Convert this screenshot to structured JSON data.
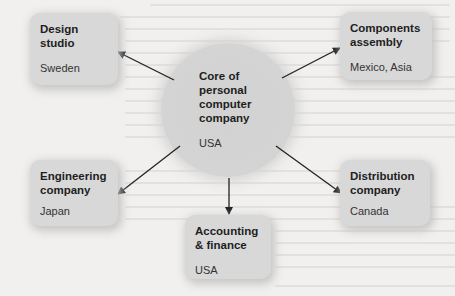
{
  "diagram": {
    "center": {
      "title": "Core of\npersonal\ncomputer\ncompany",
      "location": "USA"
    },
    "nodes": [
      {
        "id": "design",
        "title": "Design\nstudio",
        "location": "Sweden"
      },
      {
        "id": "components",
        "title": "Components\nassembly",
        "location": "Mexico, Asia"
      },
      {
        "id": "engineering",
        "title": "Engineering\ncompany",
        "location": "Japan"
      },
      {
        "id": "accounting",
        "title": "Accounting\n& finance",
        "location": "USA"
      },
      {
        "id": "distribution",
        "title": "Distribution\ncompany",
        "location": "Canada"
      }
    ],
    "edges": [
      {
        "from": "center",
        "to": "design"
      },
      {
        "from": "center",
        "to": "components"
      },
      {
        "from": "center",
        "to": "engineering"
      },
      {
        "from": "center",
        "to": "accounting"
      },
      {
        "from": "center",
        "to": "distribution"
      }
    ],
    "colors": {
      "background": "#f1f0ee",
      "box": "#d8d8d8",
      "circle": "#d3d3d3",
      "arrow": "#222222",
      "text": "#1e1e1e"
    }
  }
}
